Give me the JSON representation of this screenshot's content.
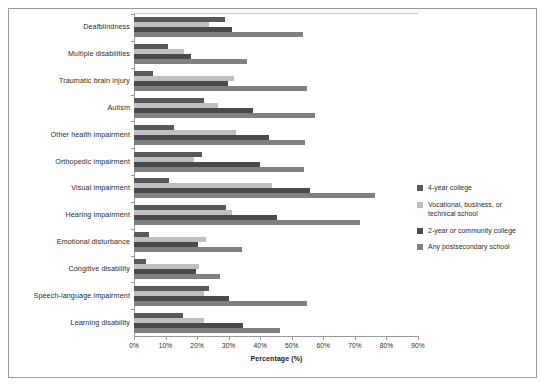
{
  "chart_data": {
    "type": "bar",
    "orientation": "horizontal",
    "title": "",
    "subtitle": "",
    "xlabel": "Percentage (%)",
    "ylabel": "",
    "xlim": [
      0,
      90
    ],
    "xtick_labels": [
      "0%",
      "10%",
      "20%",
      "30%",
      "40%",
      "50%",
      "60%",
      "70%",
      "80%",
      "90%"
    ],
    "xtick_values": [
      0,
      10,
      20,
      30,
      40,
      50,
      60,
      70,
      80,
      90
    ],
    "grid": false,
    "legend_position": "right",
    "categories": [
      "Deafblindness",
      "Multiple disabilities",
      "Traumatic brain injury",
      "Autism",
      "Other health impairment",
      "Orthopedic impairment",
      "Visual impairment",
      "Hearing impairment",
      "Emotional disturbance",
      "Congitive disability",
      "Speech-language impairment",
      "Learning disability"
    ],
    "series": [
      {
        "name": "4-year college",
        "color": "#595959",
        "values": [
          28.8,
          10.8,
          6.0,
          22.2,
          12.7,
          21.5,
          11.0,
          29.1,
          4.7,
          3.8,
          23.7,
          15.5
        ]
      },
      {
        "name": "Vocational, business, or technical school",
        "color": "#bfbfbf",
        "values": [
          23.7,
          15.8,
          31.6,
          26.6,
          32.3,
          19.0,
          43.7,
          31.0,
          22.8,
          20.6,
          22.2,
          22.2
        ]
      },
      {
        "name": "2-year or community college",
        "color": "#4a4a4a",
        "values": [
          31.0,
          18.0,
          29.8,
          37.7,
          42.7,
          39.9,
          55.7,
          45.2,
          20.3,
          19.6,
          30.1,
          34.5
        ]
      },
      {
        "name": "Any postsecondary school",
        "color": "#808080",
        "values": [
          53.5,
          35.8,
          54.7,
          57.3,
          54.1,
          53.8,
          76.3,
          71.5,
          34.2,
          27.2,
          54.7,
          46.2
        ]
      }
    ]
  },
  "legend": {
    "items": [
      {
        "label": "4-year college",
        "color": "#595959"
      },
      {
        "label": "Vocational, business, or technical school",
        "color": "#bfbfbf"
      },
      {
        "label": "2-year or community college",
        "color": "#4a4a4a"
      },
      {
        "label": "Any postsecondary school",
        "color": "#808080"
      }
    ]
  },
  "axis": {
    "x_title": "Percentage (%)"
  }
}
